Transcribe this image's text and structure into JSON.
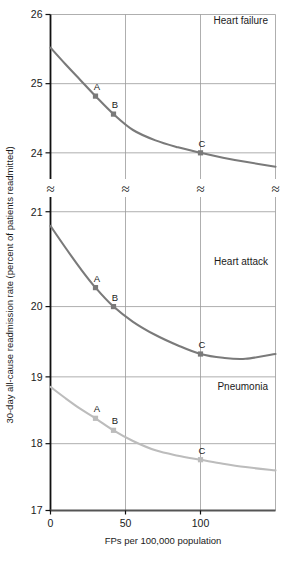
{
  "chart_data": {
    "type": "line",
    "title": "",
    "xlabel": "FPs per 100,000 population",
    "ylabel": "30-day all-cause readmission rate (percent of patients readmitted)",
    "xlim": [
      0,
      150
    ],
    "xticks": [
      0,
      50,
      100
    ],
    "xticklabels": [
      "0",
      "50",
      "100"
    ],
    "grid": true,
    "legend_position": "in-panel",
    "axis_break": true,
    "axis_break_symbol": "≈",
    "panels": [
      {
        "name": "Heart failure",
        "label": "Heart failure",
        "color": "#7a7a7a",
        "ylim": [
          23.6,
          26
        ],
        "yticks": [
          24,
          25,
          26
        ],
        "yticklabels": [
          "24",
          "25",
          "26"
        ],
        "x": [
          0,
          10,
          20,
          30,
          42,
          55,
          70,
          85,
          100,
          115,
          130,
          150
        ],
        "y": [
          25.52,
          25.28,
          25.05,
          24.82,
          24.56,
          24.33,
          24.18,
          24.08,
          24.0,
          23.93,
          23.87,
          23.8
        ],
        "points": [
          {
            "label": "A",
            "x": 30,
            "y": 24.82
          },
          {
            "label": "B",
            "x": 42,
            "y": 24.56
          },
          {
            "label": "C",
            "x": 100,
            "y": 24.0
          }
        ]
      },
      {
        "name": "Heart attack",
        "label": "Heart attack",
        "color": "#7a7a7a",
        "ylim": [
          19.4,
          21.15
        ],
        "yticks": [
          20,
          21
        ],
        "yticklabels": [
          "20",
          "21"
        ],
        "x": [
          0,
          10,
          20,
          30,
          42,
          55,
          70,
          85,
          100,
          115,
          130,
          150
        ],
        "y": [
          20.85,
          20.62,
          20.4,
          20.2,
          20.0,
          19.84,
          19.7,
          19.59,
          19.5,
          19.46,
          19.45,
          19.5
        ],
        "points": [
          {
            "label": "A",
            "x": 30,
            "y": 20.2
          },
          {
            "label": "B",
            "x": 42,
            "y": 20.0
          },
          {
            "label": "C",
            "x": 100,
            "y": 19.5
          }
        ]
      },
      {
        "name": "Pneumonia",
        "label": "Pneumonia",
        "color": "#bcbcbc",
        "ylim": [
          17,
          19.2
        ],
        "yticks": [
          17,
          18,
          19
        ],
        "yticklabels": [
          "17",
          "18",
          "19"
        ],
        "x": [
          0,
          10,
          20,
          30,
          42,
          55,
          70,
          85,
          100,
          115,
          130,
          150
        ],
        "y": [
          18.85,
          18.68,
          18.52,
          18.38,
          18.2,
          18.04,
          17.9,
          17.82,
          17.76,
          17.7,
          17.65,
          17.6
        ],
        "points": [
          {
            "label": "A",
            "x": 30,
            "y": 18.38
          },
          {
            "label": "B",
            "x": 42,
            "y": 18.2
          },
          {
            "label": "C",
            "x": 100,
            "y": 17.76
          }
        ]
      }
    ]
  },
  "axes": {
    "y_title": "30-day all-cause readmission rate (percent of patients readmitted)",
    "x_title": "FPs per 100,000 population",
    "x_tick_0": "0",
    "x_tick_50": "50",
    "x_tick_100": "100",
    "y_tick_26": "26",
    "y_tick_25": "25",
    "y_tick_24": "24",
    "y_tick_21": "21",
    "y_tick_20": "20",
    "y_tick_19": "19",
    "y_tick_18": "18",
    "y_tick_17": "17",
    "break_symbol": "≈"
  },
  "labels": {
    "panel1": "Heart failure",
    "panel2": "Heart attack",
    "panel3": "Pneumonia",
    "pt_a": "A",
    "pt_b": "B",
    "pt_c": "C"
  }
}
